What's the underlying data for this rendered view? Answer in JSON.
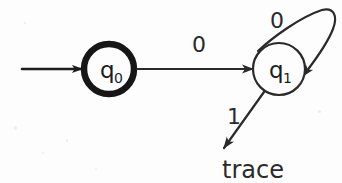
{
  "diagram": {
    "type": "finite-state-automaton",
    "background_color": "#fdfdfd",
    "stroke_color": "#1d1d1d",
    "states": [
      {
        "id": "q0",
        "label": "q",
        "subscript": "0",
        "shape": "circle",
        "emphasis": "bold",
        "cx": 109,
        "cy": 69,
        "r": 25,
        "stroke_width": 6
      },
      {
        "id": "q1",
        "label": "q",
        "subscript": "1",
        "shape": "circle",
        "emphasis": "normal",
        "cx": 279,
        "cy": 69,
        "r": 26,
        "stroke_width": 2
      }
    ],
    "terminals": [
      {
        "id": "trace",
        "label": "trace",
        "x": 248,
        "y": 172
      }
    ],
    "edges": [
      {
        "id": "start-arrow",
        "from": "",
        "to": "q0",
        "label": "",
        "kind": "start"
      },
      {
        "id": "q0-to-q1",
        "from": "q0",
        "to": "q1",
        "label": "0",
        "kind": "straight",
        "label_x": 199,
        "label_y": 52
      },
      {
        "id": "q1-self-loop",
        "from": "q1",
        "to": "q1",
        "label": "0",
        "kind": "self-loop",
        "label_x": 280,
        "label_y": 25
      },
      {
        "id": "q1-to-trace",
        "from": "q1",
        "to": "trace",
        "label": "1",
        "kind": "straight",
        "label_x": 234,
        "label_y": 124
      }
    ]
  }
}
